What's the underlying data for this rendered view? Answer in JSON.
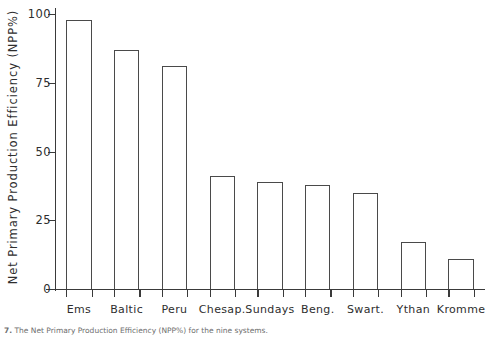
{
  "figure": {
    "background_color": "#ffffff",
    "ink_color": "#3a3a3a"
  },
  "caption": {
    "number": "7.",
    "text": "The Net Primary Production Efficiency (NPP%) for the nine systems."
  },
  "chart_data": {
    "type": "bar",
    "title": "",
    "xlabel": "",
    "ylabel": "Net Primary Production Efficiency  (NPP%)",
    "ylim": [
      0,
      100
    ],
    "yticks": [
      0,
      25,
      50,
      75,
      100
    ],
    "ytick_labels": [
      "0",
      "25",
      "50",
      "75",
      "100"
    ],
    "grid": false,
    "legend": null,
    "bar_style": {
      "fill": "none",
      "edge_color": "#4a4a4a",
      "edge_width": 1.2
    },
    "categories": [
      "Ems",
      "Baltic",
      "Peru",
      "Chesap.",
      "Sundays",
      "Beng.",
      "Swart.",
      "Ythan",
      "Kromme"
    ],
    "values": [
      98,
      87,
      81,
      41,
      39,
      38,
      35,
      17,
      11
    ],
    "series": [
      {
        "name": "NPP%",
        "values": [
          98,
          87,
          81,
          41,
          39,
          38,
          35,
          17,
          11
        ]
      }
    ]
  }
}
